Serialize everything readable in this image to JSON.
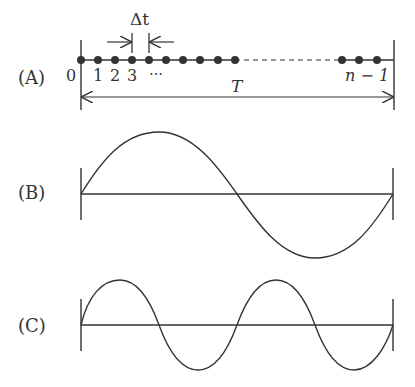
{
  "panels": {
    "A": {
      "label": "(A)",
      "delta_label": "Δt",
      "index_labels": [
        "0",
        "1",
        "2",
        "3",
        "⋯"
      ],
      "last_label": "n − 1",
      "period_label": "T",
      "sample_count_visible_start": 10,
      "sample_count_visible_end": 3
    },
    "B": {
      "label": "(B)",
      "cycles": 1
    },
    "C": {
      "label": "(C)",
      "cycles": 2
    }
  },
  "colors": {
    "stroke": "#333333",
    "background": "#ffffff"
  }
}
